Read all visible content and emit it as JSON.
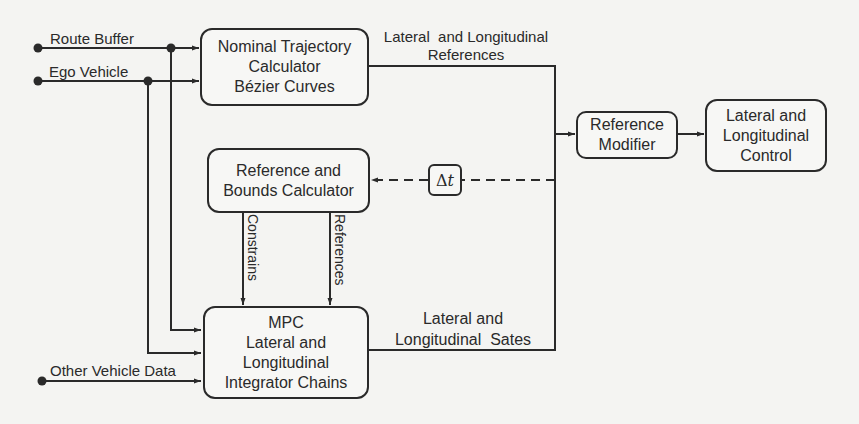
{
  "inputs": {
    "route_buffer": "Route Buffer",
    "ego_vehicle": "Ego Vehicle",
    "other_vehicle": "Other Vehicle Data"
  },
  "blocks": {
    "nominal": [
      "Nominal Trajectory",
      "Calculator",
      "Bézier Curves"
    ],
    "ref_bounds": [
      "Reference and",
      "Bounds Calculator"
    ],
    "mpc": [
      "MPC",
      "Lateral and",
      "Longitudinal",
      "Integrator Chains"
    ],
    "ref_modifier": [
      "Reference",
      "Modifier"
    ],
    "control": [
      "Lateral and",
      "Longitudinal",
      "Control"
    ],
    "delay": {
      "symbol": "Δ",
      "var": "t"
    }
  },
  "signals": {
    "references_top": [
      "Lateral  and Longitudinal",
      "References"
    ],
    "constrains": "Constrains",
    "references_vertical": "References",
    "states": [
      "Lateral and",
      "Longitudinal  Sates"
    ]
  },
  "colors": {
    "line": "#2a2a2a",
    "background": "#f4f4f2"
  }
}
